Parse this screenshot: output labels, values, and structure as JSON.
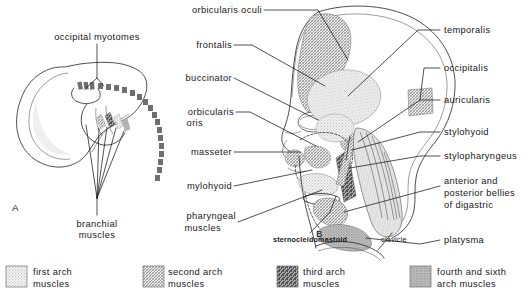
{
  "figure": {
    "panel_a": {
      "id": "A",
      "labels": [
        {
          "key": "occipital_myotomes",
          "text": "occipital myotomes"
        },
        {
          "key": "branchial_muscles_line1",
          "text": "branchial"
        },
        {
          "key": "branchial_muscles_line2",
          "text": "muscles"
        }
      ]
    },
    "panel_b": {
      "id": "B",
      "left_labels": [
        {
          "key": "orbicularis_oculi",
          "text": "orbicularis oculi"
        },
        {
          "key": "frontalis",
          "text": "frontalis"
        },
        {
          "key": "buccinator",
          "text": "buccinator"
        },
        {
          "key": "orbicularis_oris_line1",
          "text": "orbicularis"
        },
        {
          "key": "orbicularis_oris_line2",
          "text": "oris"
        },
        {
          "key": "masseter",
          "text": "masseter"
        },
        {
          "key": "mylohyoid",
          "text": "mylohyoid"
        },
        {
          "key": "pharyngeal_line1",
          "text": "pharyngeal"
        },
        {
          "key": "pharyngeal_line2",
          "text": "muscles"
        }
      ],
      "right_labels": [
        {
          "key": "temporalis",
          "text": "temporalis"
        },
        {
          "key": "occipitalis",
          "text": "occipitalis"
        },
        {
          "key": "auricularis",
          "text": "auricularis"
        },
        {
          "key": "stylohyoid",
          "text": "stylohyoid"
        },
        {
          "key": "stylopharyngeus",
          "text": "stylopharyngeus"
        },
        {
          "key": "digastric_line1",
          "text": "anterior  and"
        },
        {
          "key": "digastric_line2",
          "text": "posterior bellies"
        },
        {
          "key": "digastric_line3",
          "text": "of digastric"
        },
        {
          "key": "platysma",
          "text": "platysma"
        }
      ],
      "bottom_labels": [
        {
          "key": "sternocleidomastoid",
          "text": "sternocleidomastoid"
        },
        {
          "key": "clavicle",
          "text": "clavicle"
        }
      ]
    },
    "legend": {
      "items": [
        {
          "key": "first_arch",
          "line1": "first arch",
          "line2": "muscles",
          "pattern": "light-stipple",
          "color": "#dcdcdc"
        },
        {
          "key": "second_arch",
          "line1": "second arch",
          "line2": "muscles",
          "pattern": "fine-crosshatch",
          "color": "#b0b0b0"
        },
        {
          "key": "third_arch",
          "line1": "third arch",
          "line2": "muscles",
          "pattern": "diagonal-stripes",
          "color": "#6f6f6f"
        },
        {
          "key": "fourth_sixth_arch",
          "line1": "fourth and sixth",
          "line2": "arch muscles",
          "pattern": "solid-stipple",
          "color": "#9a9a9a"
        }
      ]
    }
  }
}
